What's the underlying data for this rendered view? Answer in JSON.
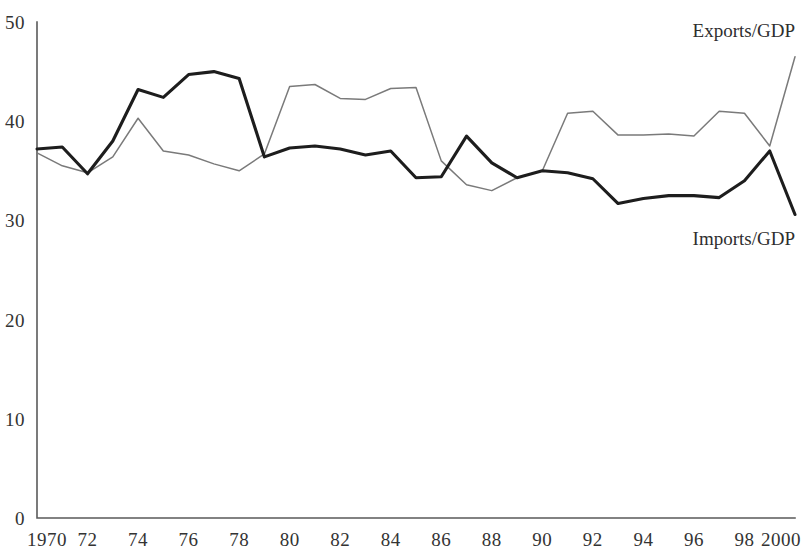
{
  "chart_data": {
    "type": "line",
    "title": "",
    "subtitle": "",
    "xlabel": "",
    "ylabel": "",
    "xlim": [
      1970,
      2000
    ],
    "ylim": [
      0,
      50
    ],
    "grid": false,
    "legend_position": "inline-right",
    "x": [
      1970,
      1971,
      1972,
      1973,
      1974,
      1975,
      1976,
      1977,
      1978,
      1979,
      1980,
      1981,
      1982,
      1983,
      1984,
      1985,
      1986,
      1987,
      1988,
      1989,
      1990,
      1991,
      1992,
      1993,
      1994,
      1995,
      1996,
      1997,
      1998,
      1999,
      2000
    ],
    "x_tick_labels": [
      "1970",
      "72",
      "74",
      "76",
      "78",
      "80",
      "82",
      "84",
      "86",
      "88",
      "90",
      "92",
      "94",
      "96",
      "98",
      "2000"
    ],
    "x_tick_values": [
      1970,
      1972,
      1974,
      1976,
      1978,
      1980,
      1982,
      1984,
      1986,
      1988,
      1990,
      1992,
      1994,
      1996,
      1998,
      2000
    ],
    "y_tick_labels": [
      "0",
      "10",
      "20",
      "30",
      "40",
      "50"
    ],
    "y_tick_values": [
      0,
      10,
      20,
      30,
      40,
      50
    ],
    "series": [
      {
        "name": "Imports/GDP",
        "label": "Imports/GDP",
        "color": "#1d1d1d",
        "style": "thick",
        "values": [
          37.2,
          37.4,
          34.7,
          38.0,
          43.2,
          42.4,
          44.7,
          45.0,
          44.3,
          36.4,
          37.3,
          37.5,
          37.2,
          36.6,
          37.0,
          34.3,
          34.4,
          38.5,
          35.8,
          34.3,
          35.0,
          34.8,
          34.2,
          31.7,
          32.2,
          32.5,
          32.5,
          32.3,
          34.0,
          37.0,
          30.6
        ]
      },
      {
        "name": "Exports/GDP",
        "label": "Exports/GDP",
        "color": "#7a7a7a",
        "style": "thin",
        "values": [
          36.8,
          35.5,
          34.8,
          36.4,
          40.3,
          37.0,
          36.6,
          35.7,
          35.0,
          36.7,
          43.5,
          43.7,
          42.3,
          42.2,
          43.3,
          43.4,
          36.0,
          33.6,
          33.0,
          34.3,
          35.0,
          40.8,
          41.0,
          38.6,
          38.6,
          38.7,
          38.5,
          41.0,
          40.8,
          37.5,
          46.5
        ]
      }
    ],
    "annotations": [
      {
        "text": "Exports/GDP",
        "x": 2000,
        "y": 48.5
      },
      {
        "text": "Imports/GDP",
        "x": 2000,
        "y": 27.5
      }
    ]
  }
}
